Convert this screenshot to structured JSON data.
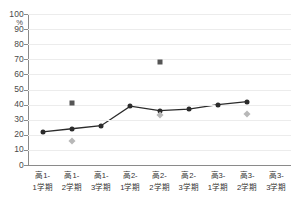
{
  "chart_data": {
    "type": "line",
    "title": "",
    "xlabel": "",
    "ylabel": "",
    "unit_label": "%",
    "ylim": [
      0,
      100
    ],
    "ytick_step": 10,
    "yticks": [
      0,
      10,
      20,
      30,
      40,
      50,
      60,
      70,
      80,
      90,
      100
    ],
    "ytick_labels": [
      "0",
      "10",
      "20",
      "30",
      "40",
      "50",
      "60",
      "70",
      "80",
      "90",
      "100"
    ],
    "grid": true,
    "legend": "none",
    "categories": [
      "高1-1学期",
      "高1-2学期",
      "高1-3学期",
      "高2-1学期",
      "高2-2学期",
      "高2-3学期",
      "高3-1学期",
      "高3-2学期",
      "高3-3学期"
    ],
    "category_lines": [
      [
        "高1-",
        "1学期"
      ],
      [
        "高1-",
        "2学期"
      ],
      [
        "高1-",
        "3学期"
      ],
      [
        "高2-",
        "1学期"
      ],
      [
        "高2-",
        "2学期"
      ],
      [
        "高2-",
        "3学期"
      ],
      [
        "高3-",
        "1学期"
      ],
      [
        "高3-",
        "2学期"
      ],
      [
        "高3-",
        "3学期"
      ]
    ],
    "series": [
      {
        "name": "line-series",
        "marker": "circle",
        "color": "#2b2b2b",
        "connected": true,
        "values": [
          22,
          24,
          26,
          39,
          36,
          37,
          40,
          42,
          null
        ]
      },
      {
        "name": "square-series",
        "marker": "square",
        "color": "#555555",
        "connected": false,
        "values": [
          null,
          41,
          null,
          null,
          68,
          null,
          null,
          null,
          null
        ]
      },
      {
        "name": "diamond-series",
        "marker": "diamond",
        "color": "#b8b8b8",
        "connected": false,
        "values": [
          null,
          16,
          null,
          null,
          33,
          null,
          null,
          34,
          null
        ]
      }
    ]
  }
}
